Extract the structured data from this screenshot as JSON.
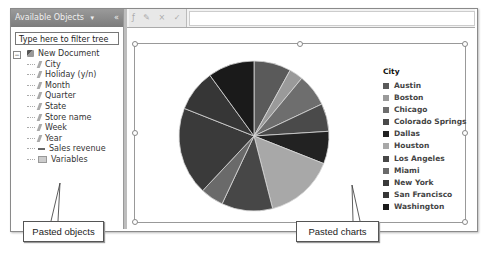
{
  "left_panel": {
    "title": "Available Objects",
    "pin_icon": "▾",
    "close_icon": "«",
    "filter": {
      "placeholder": "Type here to filter tree",
      "value": ""
    },
    "tree": {
      "root": {
        "label": "New Document",
        "expander": "−"
      },
      "items": [
        {
          "label": "City",
          "type": "dimension"
        },
        {
          "label": "Holiday (y/n)",
          "type": "dimension"
        },
        {
          "label": "Month",
          "type": "dimension"
        },
        {
          "label": "Quarter",
          "type": "dimension"
        },
        {
          "label": "State",
          "type": "dimension"
        },
        {
          "label": "Store name",
          "type": "dimension"
        },
        {
          "label": "Week",
          "type": "dimension"
        },
        {
          "label": "Year",
          "type": "dimension"
        },
        {
          "label": "Sales revenue",
          "type": "measure"
        },
        {
          "label": "Variables",
          "type": "folder"
        }
      ]
    }
  },
  "toolbar": {
    "icons": [
      "formula-icon",
      "variable-icon",
      "cancel-icon",
      "validate-icon"
    ],
    "icon_glyphs": "ƒ ✎ × ✓",
    "formula_value": ""
  },
  "chart_data": {
    "type": "pie",
    "title": "",
    "legend_title": "City",
    "legend_position": "right",
    "categories": [
      "Austin",
      "Boston",
      "Chicago",
      "Colorado Springs",
      "Dallas",
      "Houston",
      "Los Angeles",
      "Miami",
      "New York",
      "San Francisco",
      "Washington"
    ],
    "values": [
      8,
      3,
      7,
      6,
      7,
      15,
      11,
      5,
      19,
      9,
      10
    ],
    "colors": [
      "#5a5a5a",
      "#9a9a9a",
      "#6e6e6e",
      "#4a4a4a",
      "#222222",
      "#a8a8a8",
      "#474747",
      "#6a6a6a",
      "#3a3a3a",
      "#363636",
      "#1a1a1a"
    ]
  },
  "callouts": {
    "objects": "Pasted objects",
    "charts": "Pasted charts"
  }
}
